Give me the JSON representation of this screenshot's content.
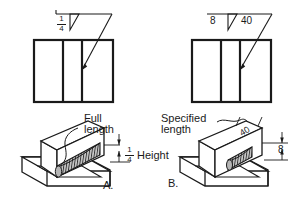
{
  "drawing": {
    "title": "Fillet weld symbol length and size comparison",
    "background_color": "#ffffff",
    "line_color": "#1a1a1a",
    "bead_fill_color": "#b8b8b8"
  },
  "panel_a": {
    "id_label": "A.",
    "symbol": {
      "size_fraction_numerator": "1",
      "size_fraction_denominator": "4",
      "length_value": "",
      "weld_symbol": "fillet-triangle"
    },
    "annotations": {
      "length_note_line1": "Full",
      "length_note_line2": "length",
      "height_fraction_numerator": "1",
      "height_fraction_denominator": "4",
      "height_label": "Height"
    }
  },
  "panel_b": {
    "id_label": "B.",
    "symbol": {
      "size_value": "8",
      "length_value": "40",
      "weld_symbol": "fillet-triangle"
    },
    "annotations": {
      "length_note_line1": "Specified",
      "length_note_line2": "length",
      "length_dim_value": "40",
      "height_dim_value": "8"
    }
  }
}
